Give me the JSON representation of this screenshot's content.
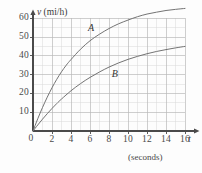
{
  "chart_data": {
    "type": "line",
    "title": "",
    "xlabel": "t",
    "ylabel": "v",
    "x_unit_caption": "(seconds)",
    "y_axis_name": "v (mi/h)",
    "y_axis_symbol": "v",
    "y_axis_units": "(mi/h)",
    "x_axis_symbol": "t",
    "xlim": [
      0,
      19
    ],
    "ylim": [
      0,
      72
    ],
    "grid": true,
    "grid_minor_step_x": 1,
    "grid_minor_step_y": 5,
    "legend_position": "inline-labels",
    "origin_label": "0",
    "xticks": [
      0,
      2,
      4,
      6,
      8,
      10,
      12,
      14,
      16
    ],
    "xtick_labels": [
      "0",
      "2",
      "4",
      "6",
      "8",
      "10",
      "12",
      "14",
      "16"
    ],
    "yticks": [
      10,
      20,
      30,
      40,
      50,
      60
    ],
    "ytick_labels": [
      "10",
      "20",
      "30",
      "40",
      "50",
      "60"
    ],
    "series": [
      {
        "name": "A",
        "label": "A",
        "color": "#6b6b6b",
        "label_x": 6.1,
        "label_y": 54,
        "x": [
          0,
          0.5,
          1,
          1.5,
          2,
          2.5,
          3,
          3.5,
          4,
          5,
          6,
          7,
          8,
          9,
          10,
          11,
          12,
          13,
          14,
          15,
          16
        ],
        "y": [
          0,
          6.5,
          12.5,
          18,
          23,
          27.5,
          31.5,
          35,
          38,
          43.5,
          48,
          51.5,
          54.5,
          57,
          59,
          60.8,
          62.2,
          63.2,
          64.1,
          64.7,
          65.2
        ]
      },
      {
        "name": "B",
        "label": "B",
        "color": "#6b6b6b",
        "label_x": 8.6,
        "label_y": 30,
        "x": [
          0,
          0.5,
          1,
          1.5,
          2,
          2.5,
          3,
          4,
          5,
          6,
          7,
          8,
          9,
          10,
          11,
          12,
          13,
          14,
          15,
          16
        ],
        "y": [
          0,
          3.2,
          6.3,
          9.2,
          12,
          14.6,
          17,
          21.4,
          25.2,
          28.5,
          31.4,
          34,
          36.2,
          38.1,
          39.7,
          41.1,
          42.3,
          43.3,
          44.2,
          45.0
        ]
      }
    ]
  },
  "colors": {
    "grid_minor": "#d9d9d9",
    "grid_major": "#b9b9b9",
    "axis": "#4a4a4a",
    "curve": "#6b6b6b",
    "background": "#fdfdfd",
    "text": "#3a3a3a"
  }
}
